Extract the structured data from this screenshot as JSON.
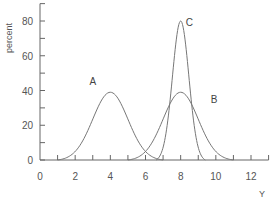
{
  "chart_data": {
    "type": "line",
    "title": "",
    "xlabel": "Y",
    "ylabel": "percent",
    "xlim": [
      0,
      13
    ],
    "ylim": [
      0,
      90
    ],
    "x_ticks": [
      0,
      2,
      4,
      6,
      8,
      10,
      12
    ],
    "x_minor_ticks": [
      1,
      3,
      5,
      7,
      9,
      11,
      13
    ],
    "y_ticks": [
      0,
      20,
      40,
      60,
      80
    ],
    "y_minor_ticks": [
      10,
      30,
      50,
      70,
      90
    ],
    "grid": false,
    "legend": "none",
    "series": [
      {
        "name": "A",
        "shape": "bell",
        "center": 4,
        "peak": 39,
        "support": [
          1,
          7
        ]
      },
      {
        "name": "B",
        "shape": "bell",
        "center": 8,
        "peak": 39,
        "support": [
          5,
          11
        ]
      },
      {
        "name": "C",
        "shape": "bell",
        "center": 8,
        "peak": 80,
        "support": [
          6.6,
          9.4
        ]
      }
    ],
    "annotations": [
      {
        "text": "A",
        "x": 3,
        "y": 43
      },
      {
        "text": "B",
        "x": 9.9,
        "y": 33
      },
      {
        "text": "C",
        "x": 8.5,
        "y": 77
      }
    ]
  }
}
